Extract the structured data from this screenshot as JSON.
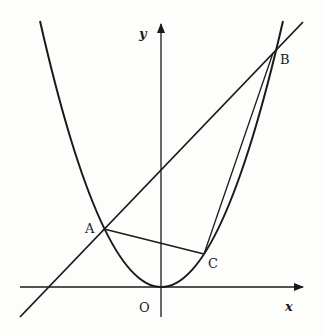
{
  "diagram": {
    "type": "parabola-with-secant-and-triangle",
    "axes": {
      "x_label": "x",
      "y_label": "y",
      "origin_label": "O"
    },
    "points": {
      "A": {
        "label": "A"
      },
      "B": {
        "label": "B"
      },
      "C": {
        "label": "C"
      }
    },
    "curves": [
      {
        "name": "parabola",
        "description": "upward parabola with vertex at O"
      },
      {
        "name": "line-AB",
        "description": "straight line through A and B"
      }
    ],
    "segments": [
      "AC",
      "CB"
    ],
    "colors": {
      "stroke": "#1a1a1a",
      "background": "#fdfdfb"
    }
  }
}
